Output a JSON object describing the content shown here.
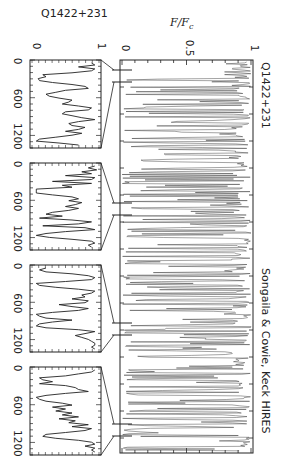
{
  "chart_data": {
    "type": "line",
    "orientation": "rotated-90-clockwise",
    "main_panel": {
      "title": "Q1422+231",
      "credit": "Songaila & Cowie, Keck HIRES",
      "ylabel": "F/F_c",
      "ylabel_display": "F/F",
      "ylabel_sub": "c",
      "ylim": [
        0,
        1
      ],
      "yticks": [
        "0",
        "0.5",
        "1"
      ],
      "description": "Full Lyman-alpha forest spectrum, normalized flux vs wavelength",
      "grid": false
    },
    "insets": [
      {
        "label": "Q1422+231",
        "xlabel_ticks": [
          "0",
          "600",
          "1200"
        ],
        "yticks": [
          "0",
          "1"
        ],
        "xrange_kms": [
          0,
          1400
        ],
        "ylim": [
          0,
          1
        ],
        "profile": [
          0.9,
          0.95,
          0.7,
          0.95,
          0.9,
          0.6,
          0.15,
          0.2,
          0.08,
          0.1,
          0.3,
          0.6,
          0.8,
          0.85,
          0.5,
          0.35,
          0.2,
          0.25,
          0.4,
          0.6,
          0.55,
          0.45,
          0.7,
          0.9,
          0.85,
          0.5,
          0.45,
          0.6,
          0.75,
          0.95,
          0.7,
          0.55,
          0.6,
          0.8,
          0.7,
          0.5,
          0.75,
          0.6,
          0.35,
          0.1,
          0.05,
          0.4,
          0.7
        ]
      },
      {
        "label": "",
        "xlabel_ticks": [
          "0",
          "600",
          "1200"
        ],
        "yticks": [
          "0",
          "1"
        ],
        "xrange_kms": [
          0,
          1400
        ],
        "ylim": [
          0,
          1
        ],
        "profile": [
          0.95,
          0.85,
          0.98,
          0.75,
          0.9,
          0.5,
          0.95,
          0.9,
          0.3,
          0.9,
          0.45,
          0.6,
          0.05,
          0.05,
          0.05,
          0.3,
          0.6,
          0.7,
          0.55,
          0.75,
          0.65,
          0.5,
          0.7,
          0.55,
          0.3,
          0.2,
          0.45,
          0.1,
          0.6,
          0.9,
          0.7,
          0.15,
          0.8,
          0.95,
          0.5,
          0.2,
          0.05,
          0.25,
          0.6,
          0.9,
          0.95,
          0.85,
          0.9
        ]
      },
      {
        "label": "",
        "xlabel_ticks": [
          "0",
          "600",
          "1200"
        ],
        "yticks": [
          "0",
          "1"
        ],
        "xrange_kms": [
          0,
          1400
        ],
        "ylim": [
          0,
          1
        ],
        "profile": [
          0.2,
          0.1,
          0.2,
          0.6,
          0.85,
          0.95,
          0.9,
          0.5,
          0.05,
          0.1,
          0.35,
          0.7,
          0.95,
          0.9,
          0.75,
          0.8,
          0.6,
          0.85,
          0.8,
          0.4,
          0.6,
          0.85,
          0.7,
          0.3,
          0.05,
          0.1,
          0.2,
          0.6,
          0.3,
          0.1,
          0.05,
          0.2,
          0.7,
          0.95,
          0.8,
          0.65,
          0.75,
          0.85,
          0.9,
          0.95,
          0.95,
          0.9,
          0.95
        ]
      },
      {
        "label": "",
        "xlabel_ticks": [
          "0",
          "600",
          "1200"
        ],
        "yticks": [
          "0",
          "1"
        ],
        "xrange_kms": [
          0,
          1400
        ],
        "ylim": [
          0,
          1
        ],
        "profile": [
          0.95,
          0.9,
          0.7,
          0.5,
          0.1,
          0.15,
          0.3,
          0.1,
          0.5,
          0.65,
          0.7,
          0.85,
          0.5,
          0.2,
          0.05,
          0.1,
          0.2,
          0.45,
          0.6,
          0.3,
          0.5,
          0.35,
          0.6,
          0.45,
          0.7,
          0.4,
          0.65,
          0.55,
          0.85,
          0.6,
          0.9,
          0.8,
          0.5,
          0.2,
          0.15,
          0.35,
          0.7,
          0.9,
          0.95,
          0.8,
          0.95,
          0.9,
          0.95
        ]
      }
    ],
    "zoom_markers_main_px": [
      [
        70,
        82
      ],
      [
        203,
        215
      ],
      [
        323,
        335
      ],
      [
        424,
        436
      ]
    ]
  },
  "colors": {
    "ink": "#222222",
    "spectrum": "#333333",
    "background": "#ffffff"
  }
}
